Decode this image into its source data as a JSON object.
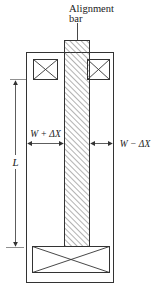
{
  "diagram": {
    "title_label": {
      "line1": "Alignment",
      "line2": "bar"
    },
    "dimension_labels": {
      "left_gap": "W + ΔX",
      "right_gap": "W − ΔX",
      "length": "L"
    },
    "colors": {
      "stroke": "#333333",
      "hatch": "#555555",
      "background": "#ffffff"
    },
    "components": [
      {
        "name": "outer-frame",
        "type": "rectangle"
      },
      {
        "name": "alignment-bar",
        "type": "hatched-rectangle"
      },
      {
        "name": "top-left-coil",
        "type": "crossed-box"
      },
      {
        "name": "top-right-coil",
        "type": "crossed-box"
      },
      {
        "name": "bottom-coil",
        "type": "crossed-box"
      }
    ]
  }
}
